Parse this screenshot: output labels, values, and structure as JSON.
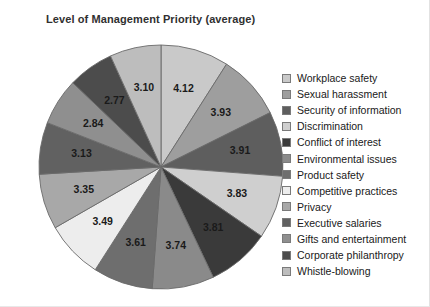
{
  "chart_data": {
    "type": "pie",
    "title": "Level of Management Priority (average)",
    "xlabel": "",
    "ylabel": "",
    "legend_position": "right",
    "grid": false,
    "categories": [
      "Workplace safety",
      "Sexual harassment",
      "Security of information",
      "Discrimination",
      "Conflict of interest",
      "Environmental issues",
      "Product safety",
      "Competitive practices",
      "Privacy",
      "Executive salaries",
      "Gifts and entertainment",
      "Corporate philanthropy",
      "Whistle-blowing"
    ],
    "values": [
      4.12,
      3.93,
      3.91,
      3.83,
      3.81,
      3.74,
      3.61,
      3.49,
      3.35,
      3.13,
      2.84,
      2.77,
      3.1
    ],
    "value_labels": [
      "4.12",
      "3.93",
      "3.91",
      "3.83",
      "3.81",
      "3.74",
      "3.61",
      "3.49",
      "3.35",
      "3.13",
      "2.84",
      "2.77",
      "3.10"
    ],
    "colors": [
      "#c9c9c9",
      "#9e9e9e",
      "#5e5e5e",
      "#cfcfcf",
      "#3a3a3a",
      "#8a8a8a",
      "#6e6e6e",
      "#ededed",
      "#a8a8a8",
      "#616161",
      "#8f8f8f",
      "#4c4c4c",
      "#bdbdbd"
    ],
    "start_angle_deg": 0,
    "direction": "clockwise"
  },
  "legend": {
    "items": [
      {
        "label": "Workplace safety",
        "color": "#c9c9c9"
      },
      {
        "label": "Sexual harassment",
        "color": "#9e9e9e"
      },
      {
        "label": "Security of information",
        "color": "#5e5e5e"
      },
      {
        "label": "Discrimination",
        "color": "#cfcfcf"
      },
      {
        "label": "Conflict of interest",
        "color": "#3a3a3a"
      },
      {
        "label": "Environmental issues",
        "color": "#8a8a8a"
      },
      {
        "label": "Product safety",
        "color": "#6e6e6e"
      },
      {
        "label": "Competitive practices",
        "color": "#ededed"
      },
      {
        "label": "Privacy",
        "color": "#a8a8a8"
      },
      {
        "label": "Executive salaries",
        "color": "#616161"
      },
      {
        "label": "Gifts and entertainment",
        "color": "#8f8f8f"
      },
      {
        "label": "Corporate philanthropy",
        "color": "#4c4c4c"
      },
      {
        "label": "Whistle-blowing",
        "color": "#bdbdbd"
      }
    ]
  }
}
